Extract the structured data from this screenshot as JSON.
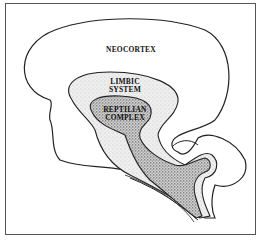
{
  "diagram": {
    "type": "triune-brain-cross-section",
    "regions": [
      {
        "id": "neocortex",
        "label": "NEOCORTEX",
        "fill": "#ffffff"
      },
      {
        "id": "limbic",
        "label_lines": [
          "LIMBIC",
          "SYSTEM"
        ],
        "fill": "#e6e6e6"
      },
      {
        "id": "reptilian",
        "label_lines": [
          "REPTILIAN",
          "COMPLEX"
        ],
        "fill": "#bdbdbd"
      }
    ],
    "colors": {
      "outline": "#222222",
      "frame": "#555555"
    }
  }
}
